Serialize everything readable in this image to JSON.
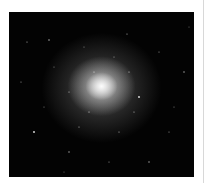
{
  "image": {
    "subject": "globular star cluster",
    "description": "Dense cluster of stars with a bright glowing core against a black sky"
  },
  "colors": {
    "background": "#ffffff",
    "sky": "#030303",
    "core": "#f2f2f2",
    "divider": "#d8d8d8"
  }
}
